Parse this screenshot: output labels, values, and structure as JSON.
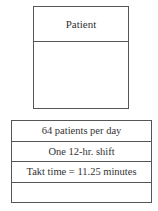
{
  "process_box": {
    "title": "Patient"
  },
  "data_box": {
    "rows": [
      {
        "text": "64 patients per day"
      },
      {
        "text": "One 12-hr. shift"
      },
      {
        "text": "Takt time = 11.25 minutes"
      },
      {
        "text": ""
      }
    ]
  }
}
